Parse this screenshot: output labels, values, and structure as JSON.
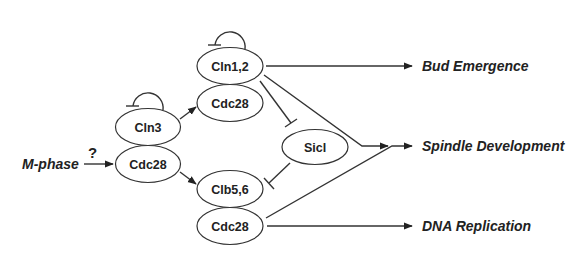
{
  "diagram": {
    "title": "",
    "nodes": [
      {
        "id": "cln12",
        "label": "Cln1,2",
        "cx": 230,
        "cy": 66
      },
      {
        "id": "cdc28_top",
        "label": "Cdc28",
        "cx": 230,
        "cy": 103
      },
      {
        "id": "cln3",
        "label": "Cln3",
        "cx": 148,
        "cy": 127
      },
      {
        "id": "cdc28_mid",
        "label": "Cdc28",
        "cx": 148,
        "cy": 164
      },
      {
        "id": "sicl",
        "label": "Sicl",
        "cx": 315,
        "cy": 147
      },
      {
        "id": "clb56",
        "label": "Clb5,6",
        "cx": 230,
        "cy": 189
      },
      {
        "id": "cdc28_bot",
        "label": "Cdc28",
        "cx": 230,
        "cy": 226
      }
    ],
    "input": {
      "label": "M-phase",
      "question": "?"
    },
    "outputs": [
      {
        "id": "bud",
        "label": "Bud Emergence"
      },
      {
        "id": "spindle",
        "label": "Spindle Development"
      },
      {
        "id": "dna",
        "label": "DNA Replication"
      }
    ],
    "edges": [
      {
        "from": "M-phase",
        "to": "cdc28_mid",
        "type": "activation",
        "uncertain": true
      },
      {
        "from": "cln3",
        "to": "cln3",
        "type": "inhibition",
        "self_loop": true
      },
      {
        "from": "cln12",
        "to": "cln12",
        "type": "inhibition",
        "self_loop": true
      },
      {
        "from": "cln3",
        "to": "cdc28_top",
        "type": "activation"
      },
      {
        "from": "cdc28_mid",
        "to": "clb56",
        "type": "activation"
      },
      {
        "from": "cln12",
        "to": "bud",
        "type": "activation"
      },
      {
        "from": "cln12",
        "to": "spindle",
        "type": "activation"
      },
      {
        "from": "cln12",
        "to": "sicl",
        "type": "inhibition"
      },
      {
        "from": "sicl",
        "to": "clb56",
        "type": "inhibition"
      },
      {
        "from": "cdc28_bot",
        "to": "spindle",
        "type": "activation"
      },
      {
        "from": "cdc28_bot",
        "to": "dna",
        "type": "activation"
      }
    ],
    "colors": {
      "stroke": "#333333",
      "text": "#222222",
      "background": "#ffffff"
    }
  }
}
